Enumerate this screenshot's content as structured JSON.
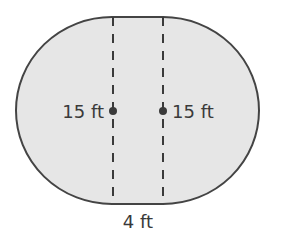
{
  "figure": {
    "colors": {
      "fill": "#e6e6e6",
      "stroke": "#444444",
      "dash": "#3a3a3a",
      "text": "#3a3a3a"
    },
    "labels": {
      "left_radius": "15 ft",
      "right_radius": "15 ft",
      "width": "4 ft"
    }
  }
}
